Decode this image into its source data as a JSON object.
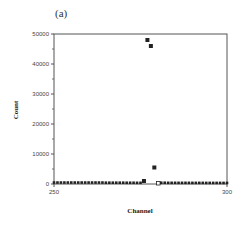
{
  "panel_label": "(a)",
  "chart_data": {
    "type": "scatter",
    "title": "",
    "panel": "(a)",
    "xlabel": "Channel",
    "ylabel": "Count",
    "xlim": [
      250,
      300
    ],
    "ylim": [
      0,
      50000
    ],
    "x_ticks": [
      250,
      300
    ],
    "x_tick_labels": [
      "250",
      "300"
    ],
    "y_ticks": [
      0,
      10000,
      20000,
      30000,
      40000,
      50000
    ],
    "y_tick_labels": [
      "0",
      "10000",
      "20000",
      "30000",
      "40000",
      "50000"
    ],
    "grid": false,
    "legend": null,
    "marker": "filled square",
    "series": [
      {
        "name": "counts",
        "x": [
          250,
          251,
          252,
          253,
          254,
          255,
          256,
          257,
          258,
          259,
          260,
          261,
          262,
          263,
          264,
          265,
          266,
          267,
          268,
          269,
          270,
          271,
          272,
          273,
          274,
          275,
          276,
          277,
          278,
          279,
          280,
          281,
          282,
          283,
          284,
          285,
          286,
          287,
          288,
          289,
          290,
          291,
          292,
          293,
          294,
          295,
          296,
          297,
          298,
          299,
          300
        ],
        "y": [
          150,
          150,
          150,
          150,
          150,
          150,
          150,
          150,
          150,
          150,
          150,
          150,
          150,
          150,
          150,
          100,
          100,
          100,
          100,
          100,
          100,
          80,
          80,
          80,
          60,
          60,
          1000,
          48000,
          46000,
          5500,
          100,
          80,
          80,
          60,
          60,
          60,
          50,
          50,
          50,
          50,
          40,
          40,
          40,
          40,
          30,
          30,
          30,
          30,
          30,
          20,
          20
        ]
      }
    ],
    "annotations": [
      "hollow square at channel 280 near 0 count"
    ]
  }
}
